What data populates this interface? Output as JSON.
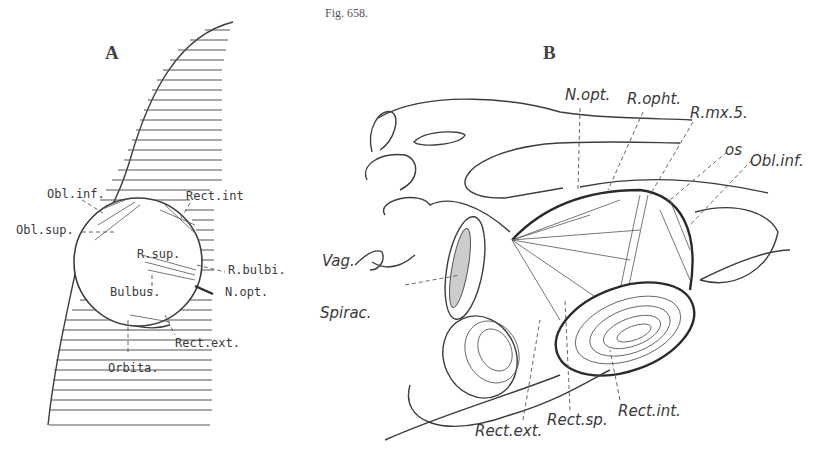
{
  "figure": {
    "caption": "Fig. 658.",
    "panels": [
      {
        "id": "A",
        "letter": "A",
        "labels": {
          "obl_inf": "Obl.inf.",
          "obl_sup": "Obl.sup.",
          "rect_int": "Rect.int",
          "r_sup": "R.sup.",
          "r_bulbi": "R.bulbi.",
          "bulbus": "Bulbus.",
          "n_opt": "N.opt.",
          "rect_ext": "Rect.ext.",
          "orbita": "Orbita."
        }
      },
      {
        "id": "B",
        "letter": "B",
        "labels": {
          "n_opt": "N.opt.",
          "r_opht": "R.opht.",
          "r_mx5": "R.mx.5.",
          "os": "os",
          "obl_inf": "Obl.inf.",
          "vag": "Vag.",
          "spirac": "Spirac.",
          "rect_ext": "Rect.ext.",
          "rect_sp": "Rect.sp.",
          "rect_int": "Rect.int."
        }
      }
    ]
  }
}
